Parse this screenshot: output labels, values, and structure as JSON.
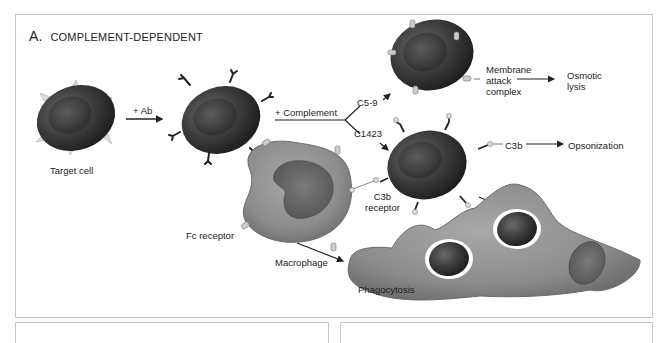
{
  "figure": {
    "panel_letter": "A.",
    "panel_title": "COMPLEMENT-DEPENDENT"
  },
  "labels": {
    "target_cell": "Target cell",
    "plus_ab": "+ Ab",
    "plus_complement": "+ Complement",
    "c5_9": "C5-9",
    "c1423": "C1423",
    "mac_line1": "Membrane",
    "mac_line2": "attack",
    "mac_line3": "complex",
    "osmotic_line1": "Osmotic",
    "osmotic_line2": "lysis",
    "c3b": "C3b",
    "opsonization": "Opsonization",
    "c3b_receptor_line1": "C3b",
    "c3b_receptor_line2": "receptor",
    "fc_receptor": "Fc receptor",
    "macrophage": "Macrophage",
    "phagocytosis": "Phagocytosis"
  },
  "colors": {
    "cell_dark": "#2e2e2e",
    "macrophage_gray": "#8a8a8a",
    "border": "#c8c8c8",
    "arrow": "#222222"
  }
}
